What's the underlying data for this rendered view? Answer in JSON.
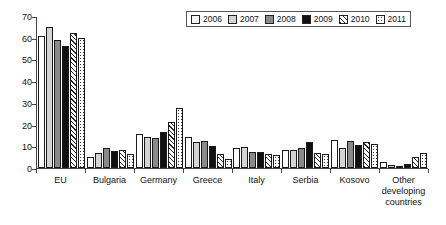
{
  "chart_data": {
    "type": "bar",
    "title": "",
    "subtitle": "",
    "xlabel": "",
    "ylabel": "",
    "ylim": [
      0,
      70
    ],
    "yticks": [
      0,
      10,
      20,
      30,
      40,
      50,
      60,
      70
    ],
    "ytick_labels": [
      "0",
      "10",
      "20",
      "30",
      "40",
      "50",
      "60",
      "70"
    ],
    "grid": false,
    "legend_position": "top-right",
    "categories": [
      "EU",
      "Bulgaria",
      "Germany",
      "Greece",
      "Italy",
      "Serbia",
      "Kosovo",
      "Other developing countries"
    ],
    "category_lines": [
      [
        "EU"
      ],
      [
        "Bulgaria"
      ],
      [
        "Germany"
      ],
      [
        "Greece"
      ],
      [
        "Italy"
      ],
      [
        "Serbia"
      ],
      [
        "Kosovo"
      ],
      [
        "Other",
        "developing",
        "countries"
      ]
    ],
    "series": [
      {
        "name": "2006",
        "pattern": "solid-white",
        "color": "#ffffff",
        "values": [
          61,
          5,
          15.5,
          14.5,
          9,
          8.5,
          13,
          3
        ]
      },
      {
        "name": "2007",
        "pattern": "solid-lightgray",
        "color": "#d4d4d4",
        "values": [
          65,
          7,
          14.5,
          12,
          9.5,
          8.5,
          9,
          1.5
        ]
      },
      {
        "name": "2008",
        "pattern": "solid-gray",
        "color": "#8a8a8a",
        "values": [
          59,
          9,
          14,
          12.5,
          7.5,
          9,
          12.5,
          1
        ]
      },
      {
        "name": "2009",
        "pattern": "solid-black",
        "color": "#111111",
        "values": [
          56,
          8,
          16.5,
          10,
          7.5,
          12,
          10.5,
          2
        ]
      },
      {
        "name": "2010",
        "pattern": "diagonal-hatch",
        "color": "#ffffff",
        "values": [
          62,
          8.5,
          21,
          6.5,
          6.5,
          7,
          12,
          5
        ]
      },
      {
        "name": "2011",
        "pattern": "dotted",
        "color": "#ffffff",
        "values": [
          60,
          6.5,
          27.5,
          4,
          6,
          6.5,
          11,
          7
        ]
      }
    ]
  },
  "legend": {
    "items": [
      {
        "label": "2006"
      },
      {
        "label": "2007"
      },
      {
        "label": "2008"
      },
      {
        "label": "2009"
      },
      {
        "label": "2010"
      },
      {
        "label": "2011"
      }
    ]
  }
}
